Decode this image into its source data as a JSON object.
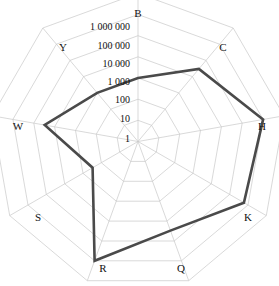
{
  "chart_data": {
    "type": "radar",
    "title": "",
    "scale": "log10",
    "ylim": [
      1,
      1000000
    ],
    "grid": true,
    "legend": "none",
    "categories": [
      "B",
      "C",
      "H",
      "K",
      "Q",
      "R",
      "S",
      "W",
      "Y"
    ],
    "tick_labels": [
      "1",
      "10",
      "100",
      "1 000",
      "10 000",
      "100 000",
      "1 000 000"
    ],
    "tick_values": [
      1,
      10,
      100,
      1000,
      10000,
      100000,
      1000000
    ],
    "series": [
      {
        "name": "series-1",
        "color": "#4a4a4a",
        "values": [
          100,
          3000,
          100000,
          60000,
          3000,
          100000,
          30,
          3000,
          100
        ]
      }
    ],
    "axis_label_positions": {
      "B": "top",
      "C": "upper-right",
      "H": "right",
      "K": "lower-right",
      "Q": "bottom-right",
      "R": "bottom-left",
      "S": "lower-left",
      "W": "left",
      "Y": "upper-left"
    }
  },
  "labels": {
    "B": "B",
    "C": "C",
    "H": "H",
    "K": "K",
    "Q": "Q",
    "R": "R",
    "S": "S",
    "W": "W",
    "Y": "Y"
  },
  "ticks": {
    "t1": "1",
    "t2": "10",
    "t3": "100",
    "t4": "1 000",
    "t5": "10 000",
    "t6": "100 000",
    "t7": "1 000 000"
  },
  "colors": {
    "series": "#4a4a4a",
    "grid": "#c9c9c9",
    "text": "#111111",
    "background": "#ffffff"
  }
}
